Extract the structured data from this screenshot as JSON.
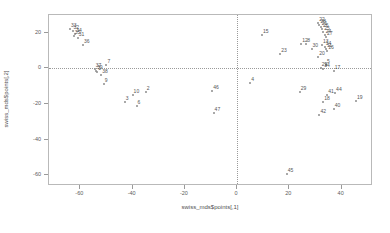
{
  "chart_data": {
    "type": "scatter",
    "title": "",
    "xlabel": "swiss_mds$points[,1]",
    "ylabel": "swiss_mds$points[,2]",
    "xlim": [
      -72,
      52
    ],
    "ylim": [
      -66,
      30
    ],
    "xticks": [
      -60,
      -40,
      -20,
      0,
      20,
      40
    ],
    "xtick_labels": [
      "-60",
      "-40",
      "-20",
      "0",
      "20",
      "40"
    ],
    "yticks": [
      20,
      0,
      -20,
      -40,
      -60
    ],
    "ytick_labels": [
      "20",
      "0",
      "-20",
      "-40",
      "-60"
    ],
    "grid": false,
    "legend": "none",
    "reference_lines": {
      "vertical_x": 0,
      "horizontal_y": 0,
      "style": "dotted"
    },
    "point_label_position": "right",
    "points": [
      {
        "label": "33",
        "x": -64.0,
        "y": 22.0
      },
      {
        "label": "32",
        "x": -63.0,
        "y": 21.0
      },
      {
        "label": "34",
        "x": -62.0,
        "y": 19.5
      },
      {
        "label": "35",
        "x": -62.5,
        "y": 18.0
      },
      {
        "label": "31",
        "x": -61.0,
        "y": 17.0
      },
      {
        "label": "36",
        "x": -59.0,
        "y": 13.0
      },
      {
        "label": "7",
        "x": -50.0,
        "y": 2.0
      },
      {
        "label": "37",
        "x": -54.5,
        "y": -0.5
      },
      {
        "label": "39",
        "x": -54.0,
        "y": -1.5
      },
      {
        "label": "1",
        "x": -53.5,
        "y": -2.0
      },
      {
        "label": "38",
        "x": -52.0,
        "y": -3.5
      },
      {
        "label": "9",
        "x": -51.0,
        "y": -9.0
      },
      {
        "label": "10",
        "x": -40.0,
        "y": -15.0
      },
      {
        "label": "2",
        "x": -35.0,
        "y": -13.5
      },
      {
        "label": "3",
        "x": -43.0,
        "y": -19.0
      },
      {
        "label": "6",
        "x": -38.5,
        "y": -21.0
      },
      {
        "label": "46",
        "x": -9.5,
        "y": -12.5
      },
      {
        "label": "47",
        "x": -9.0,
        "y": -25.0
      },
      {
        "label": "15",
        "x": 9.5,
        "y": 19.0
      },
      {
        "label": "4",
        "x": 5.0,
        "y": -8.0
      },
      {
        "label": "23",
        "x": 16.5,
        "y": 8.0
      },
      {
        "label": "12",
        "x": 24.5,
        "y": 14.0
      },
      {
        "label": "8",
        "x": 26.5,
        "y": 13.5
      },
      {
        "label": "30",
        "x": 28.5,
        "y": 11.0
      },
      {
        "label": "22",
        "x": 31.0,
        "y": 25.5
      },
      {
        "label": "28",
        "x": 31.5,
        "y": 24.5
      },
      {
        "label": "21",
        "x": 32.0,
        "y": 23.5
      },
      {
        "label": "26",
        "x": 32.5,
        "y": 22.0
      },
      {
        "label": "25",
        "x": 33.0,
        "y": 20.5
      },
      {
        "label": "24",
        "x": 33.5,
        "y": 19.0
      },
      {
        "label": "27",
        "x": 34.0,
        "y": 17.5
      },
      {
        "label": "13",
        "x": 32.5,
        "y": 13.0
      },
      {
        "label": "14",
        "x": 33.5,
        "y": 12.0
      },
      {
        "label": "11",
        "x": 34.0,
        "y": 11.0
      },
      {
        "label": "16",
        "x": 34.5,
        "y": 10.0
      },
      {
        "label": "20",
        "x": 31.0,
        "y": 6.5
      },
      {
        "label": "5",
        "x": 34.0,
        "y": 2.0
      },
      {
        "label": "29",
        "x": 32.0,
        "y": 0.5
      },
      {
        "label": "34b",
        "x": 33.0,
        "y": -0.5
      },
      {
        "label": "17",
        "x": 37.0,
        "y": -1.5
      },
      {
        "label": "29b",
        "x": 24.0,
        "y": -13.0
      },
      {
        "label": "41",
        "x": 34.5,
        "y": -15.0
      },
      {
        "label": "44",
        "x": 37.5,
        "y": -14.0
      },
      {
        "label": "18",
        "x": 33.0,
        "y": -19.0
      },
      {
        "label": "19",
        "x": 45.5,
        "y": -18.0
      },
      {
        "label": "40",
        "x": 37.0,
        "y": -23.0
      },
      {
        "label": "42",
        "x": 31.5,
        "y": -26.0
      },
      {
        "label": "45",
        "x": 19.0,
        "y": -59.0
      }
    ]
  }
}
